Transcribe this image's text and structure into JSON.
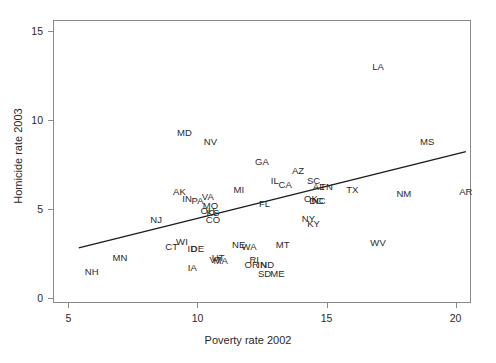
{
  "chart_data": {
    "type": "scatter",
    "title": "",
    "xlabel": "Poverty rate 2002",
    "ylabel": "Homicide rate 2003",
    "xlim": [
      4.4,
      20.6
    ],
    "ylim": [
      -0.3,
      15.6
    ],
    "xticks": [
      5,
      10,
      15,
      20
    ],
    "yticks": [
      0,
      5,
      10,
      15
    ],
    "grid": false,
    "legend": null,
    "point_style": "text-labels",
    "trendline": {
      "type": "linear",
      "x_start": 5.4,
      "y_start": 2.8,
      "x_end": 20.4,
      "y_end": 8.2
    },
    "points": [
      {
        "label": "LA",
        "x": 17.0,
        "y": 13.0
      },
      {
        "label": "MD",
        "x": 9.5,
        "y": 9.3
      },
      {
        "label": "NV",
        "x": 10.5,
        "y": 8.8
      },
      {
        "label": "MS",
        "x": 18.9,
        "y": 8.8
      },
      {
        "label": "GA",
        "x": 12.5,
        "y": 7.7
      },
      {
        "label": "AZ",
        "x": 13.9,
        "y": 7.2
      },
      {
        "label": "IL",
        "x": 13.0,
        "y": 6.6
      },
      {
        "label": "CA",
        "x": 13.4,
        "y": 6.4
      },
      {
        "label": "SC",
        "x": 14.5,
        "y": 6.6
      },
      {
        "label": "AL",
        "x": 14.7,
        "y": 6.3
      },
      {
        "label": "TN",
        "x": 15.0,
        "y": 6.3
      },
      {
        "label": "TX",
        "x": 16.0,
        "y": 6.1
      },
      {
        "label": "NM",
        "x": 18.0,
        "y": 5.9
      },
      {
        "label": "AR",
        "x": 20.4,
        "y": 6.0
      },
      {
        "label": "MI",
        "x": 11.6,
        "y": 6.1
      },
      {
        "label": "AK",
        "x": 9.3,
        "y": 6.0
      },
      {
        "label": "IN",
        "x": 9.6,
        "y": 5.6
      },
      {
        "label": "PA",
        "x": 10.0,
        "y": 5.5
      },
      {
        "label": "VA",
        "x": 10.4,
        "y": 5.7
      },
      {
        "label": "MO",
        "x": 10.5,
        "y": 5.2
      },
      {
        "label": "OH",
        "x": 10.4,
        "y": 4.9
      },
      {
        "label": "KS",
        "x": 10.6,
        "y": 4.8
      },
      {
        "label": "CO",
        "x": 10.6,
        "y": 4.4
      },
      {
        "label": "FL",
        "x": 12.6,
        "y": 5.3
      },
      {
        "label": "OK",
        "x": 14.4,
        "y": 5.6
      },
      {
        "label": "NC",
        "x": 14.7,
        "y": 5.5
      },
      {
        "label": "DC",
        "x": 14.6,
        "y": 5.5
      },
      {
        "label": "NY",
        "x": 14.3,
        "y": 4.5
      },
      {
        "label": "KY",
        "x": 14.5,
        "y": 4.2
      },
      {
        "label": "NJ",
        "x": 8.4,
        "y": 4.4
      },
      {
        "label": "WI",
        "x": 9.4,
        "y": 3.2
      },
      {
        "label": "CT",
        "x": 9.0,
        "y": 2.9
      },
      {
        "label": "ID",
        "x": 9.8,
        "y": 2.8
      },
      {
        "label": "DE",
        "x": 10.0,
        "y": 2.8
      },
      {
        "label": "NE",
        "x": 11.6,
        "y": 3.0
      },
      {
        "label": "WA",
        "x": 12.0,
        "y": 2.9
      },
      {
        "label": "UT",
        "x": 10.8,
        "y": 2.3
      },
      {
        "label": "VT",
        "x": 10.7,
        "y": 2.2
      },
      {
        "label": "MA",
        "x": 10.9,
        "y": 2.1
      },
      {
        "label": "RI",
        "x": 12.2,
        "y": 2.2
      },
      {
        "label": "OR",
        "x": 12.1,
        "y": 1.9
      },
      {
        "label": "IN2",
        "x": 12.5,
        "y": 1.9
      },
      {
        "label": "ND",
        "x": 12.7,
        "y": 1.9
      },
      {
        "label": "SD",
        "x": 12.6,
        "y": 1.4
      },
      {
        "label": "IA",
        "x": 9.8,
        "y": 1.7
      },
      {
        "label": "MT",
        "x": 13.3,
        "y": 3.0
      },
      {
        "label": "WV",
        "x": 17.0,
        "y": 3.1
      },
      {
        "label": "ME",
        "x": 13.1,
        "y": 1.4
      },
      {
        "label": "MN",
        "x": 7.0,
        "y": 2.3
      },
      {
        "label": "NH",
        "x": 5.9,
        "y": 1.5
      }
    ]
  }
}
